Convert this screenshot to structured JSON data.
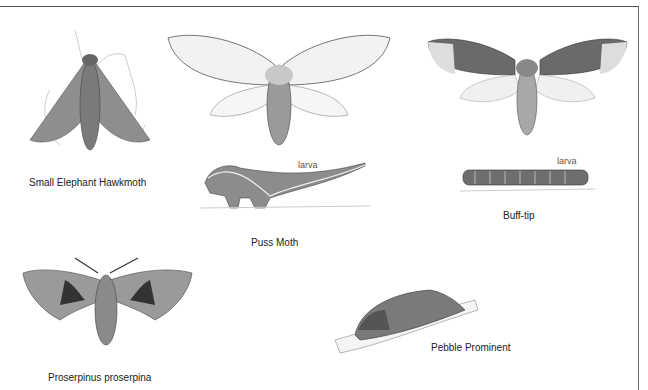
{
  "plate": {
    "specimens": [
      {
        "id": "small-elephant-hawkmoth",
        "caption": "Small Elephant Hawkmoth"
      },
      {
        "id": "puss-moth",
        "caption": "Puss Moth",
        "larva_label": "larva"
      },
      {
        "id": "buff-tip",
        "caption": "Buff-tip",
        "larva_label": "larva"
      },
      {
        "id": "proserpinus-proserpina",
        "caption": "Proserpinus proserpina"
      },
      {
        "id": "pebble-prominent",
        "caption": "Pebble Prominent"
      }
    ]
  },
  "colors": {
    "frame": "#555555",
    "text": "#222222",
    "moth_grey": "#8a8a8a",
    "moth_dark": "#3a3a3a"
  }
}
